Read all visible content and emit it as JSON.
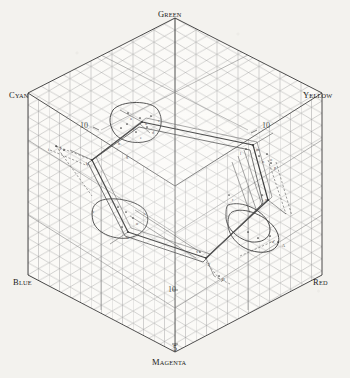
{
  "figure": {
    "background_color": "#f3f2ee",
    "ink_color": "#1a1a1a",
    "grid_color": "#8d8d8d",
    "width": 350,
    "height": 378
  },
  "corner_labels": [
    {
      "name": "green",
      "head": "G",
      "rest": "REEN",
      "x": 158,
      "y": 4,
      "align": "center"
    },
    {
      "name": "cyan",
      "head": "C",
      "rest": "YAN",
      "x": 9,
      "y": 85,
      "align": "left"
    },
    {
      "name": "yellow",
      "head": "Y",
      "rest": "ELLOW",
      "x": 303,
      "y": 85,
      "align": "left"
    },
    {
      "name": "blue",
      "head": "B",
      "rest": "LUE",
      "x": 13,
      "y": 272,
      "align": "left"
    },
    {
      "name": "red",
      "head": "R",
      "rest": "ED",
      "x": 313,
      "y": 272,
      "align": "left"
    },
    {
      "name": "magenta",
      "head": "M",
      "rest": "AGENTA",
      "x": 152,
      "y": 352,
      "align": "left"
    }
  ],
  "tick_labels": [
    {
      "name": "tick-upper-left",
      "value": "10",
      "x": 80,
      "y": 122
    },
    {
      "name": "tick-upper-right",
      "value": "10",
      "x": 262,
      "y": 122
    },
    {
      "name": "tick-lower",
      "value": "10",
      "x": 168,
      "y": 286
    },
    {
      "name": "tick-magenta",
      "value": "5",
      "x": 173,
      "y": 345
    }
  ],
  "point_labels": [
    {
      "t": "a",
      "x": 130,
      "y": 117
    },
    {
      "t": "b",
      "x": 145,
      "y": 122
    },
    {
      "t": "c",
      "x": 158,
      "y": 119
    },
    {
      "t": "d",
      "x": 152,
      "y": 131
    },
    {
      "t": "e",
      "x": 140,
      "y": 136
    },
    {
      "t": "f",
      "x": 133,
      "y": 128
    },
    {
      "t": "g",
      "x": 126,
      "y": 155
    },
    {
      "t": "h",
      "x": 118,
      "y": 142
    },
    {
      "t": "i",
      "x": 48,
      "y": 148
    },
    {
      "t": "j",
      "x": 60,
      "y": 146
    },
    {
      "t": "k",
      "x": 86,
      "y": 162
    },
    {
      "t": "l",
      "x": 240,
      "y": 152
    },
    {
      "t": "m",
      "x": 256,
      "y": 148
    },
    {
      "t": "n",
      "x": 262,
      "y": 160
    },
    {
      "t": "o",
      "x": 270,
      "y": 158
    },
    {
      "t": "p",
      "x": 274,
      "y": 166
    },
    {
      "t": "q",
      "x": 265,
      "y": 198
    },
    {
      "t": "r",
      "x": 232,
      "y": 198
    },
    {
      "t": "s",
      "x": 144,
      "y": 212
    },
    {
      "t": "u",
      "x": 136,
      "y": 222
    },
    {
      "t": "v",
      "x": 92,
      "y": 210
    },
    {
      "t": "w",
      "x": 126,
      "y": 236
    },
    {
      "t": "x",
      "x": 196,
      "y": 250
    },
    {
      "t": "y",
      "x": 208,
      "y": 262
    },
    {
      "t": "z",
      "x": 272,
      "y": 240
    },
    {
      "t": "A",
      "x": 282,
      "y": 244
    },
    {
      "t": "B",
      "x": 222,
      "y": 278
    }
  ]
}
